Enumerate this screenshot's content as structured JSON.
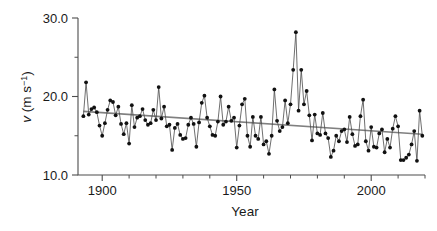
{
  "chart_data": {
    "type": "line",
    "title": "",
    "xlabel": "Year",
    "ylabel": "v (m s−1)",
    "ylabel_parts": {
      "italic": "v",
      "unit_open": " (m s",
      "exponent": "−1",
      "unit_close": ")"
    },
    "xlim": [
      1891,
      2020
    ],
    "ylim": [
      10.0,
      30.0
    ],
    "grid": false,
    "legend": null,
    "x_ticks_major": [
      1900,
      1950,
      2000
    ],
    "x_tick_labels": [
      "1900",
      "1950",
      "2000"
    ],
    "x_ticks_minor": [
      1900,
      1910,
      1920,
      1930,
      1940,
      1950,
      1960,
      1970,
      1980,
      1990,
      2000,
      2010,
      2020
    ],
    "y_ticks_major": [
      10.0,
      20.0,
      30.0
    ],
    "y_tick_labels": [
      "10.0",
      "20.0",
      "30.0"
    ],
    "y_ticks_minor": [
      15.0,
      25.0
    ],
    "marker_style": "filled-circle",
    "series": [
      {
        "name": "annual mean wind speed",
        "color": "#111111",
        "x": [
          1893,
          1894,
          1895,
          1896,
          1897,
          1898,
          1899,
          1900,
          1901,
          1902,
          1903,
          1904,
          1905,
          1906,
          1907,
          1908,
          1909,
          1910,
          1911,
          1912,
          1913,
          1914,
          1915,
          1916,
          1917,
          1918,
          1919,
          1920,
          1921,
          1922,
          1923,
          1924,
          1925,
          1926,
          1927,
          1928,
          1929,
          1930,
          1931,
          1932,
          1933,
          1934,
          1935,
          1936,
          1937,
          1938,
          1939,
          1940,
          1941,
          1942,
          1943,
          1944,
          1945,
          1946,
          1947,
          1948,
          1949,
          1950,
          1951,
          1952,
          1953,
          1954,
          1955,
          1956,
          1957,
          1958,
          1959,
          1960,
          1961,
          1962,
          1963,
          1964,
          1965,
          1966,
          1967,
          1968,
          1969,
          1970,
          1971,
          1972,
          1973,
          1974,
          1975,
          1976,
          1977,
          1978,
          1979,
          1980,
          1981,
          1982,
          1983,
          1984,
          1985,
          1986,
          1987,
          1988,
          1989,
          1990,
          1991,
          1992,
          1993,
          1994,
          1995,
          1996,
          1997,
          1998,
          1999,
          2000,
          2001,
          2002,
          2003,
          2004,
          2005,
          2006,
          2007,
          2008,
          2009,
          2010,
          2011,
          2012,
          2013,
          2014,
          2015,
          2016,
          2017,
          2018,
          2019
        ],
        "values": [
          17.5,
          21.8,
          17.7,
          18.4,
          18.6,
          18.0,
          16.3,
          15.0,
          16.6,
          18.3,
          19.5,
          19.3,
          17.6,
          18.7,
          16.5,
          15.2,
          16.6,
          14.0,
          18.9,
          16.1,
          17.3,
          17.5,
          18.4,
          17.0,
          16.4,
          16.6,
          18.3,
          17.0,
          21.2,
          17.2,
          18.7,
          16.2,
          16.4,
          13.2,
          16.0,
          16.5,
          15.1,
          14.6,
          14.7,
          16.4,
          17.3,
          16.5,
          13.6,
          16.7,
          19.2,
          20.1,
          17.3,
          16.2,
          15.1,
          15.0,
          16.8,
          20.0,
          16.4,
          16.8,
          18.7,
          16.9,
          17.3,
          13.5,
          16.3,
          19.0,
          19.7,
          15.0,
          13.6,
          17.4,
          15.0,
          14.6,
          17.4,
          13.9,
          14.3,
          12.7,
          15.0,
          20.9,
          16.9,
          15.6,
          16.1,
          19.5,
          16.6,
          19.0,
          23.4,
          28.2,
          18.2,
          23.4,
          19.0,
          20.7,
          17.6,
          14.4,
          17.7,
          15.3,
          15.1,
          17.9,
          15.3,
          14.7,
          12.3,
          13.1,
          15.0,
          14.3,
          15.6,
          15.8,
          14.2,
          17.4,
          15.2,
          13.7,
          13.9,
          17.5,
          19.6,
          14.3,
          13.1,
          16.1,
          13.6,
          13.5,
          15.3,
          15.8,
          12.9,
          14.6,
          13.5,
          15.9,
          17.5,
          16.2,
          11.9,
          11.9,
          12.2,
          12.6,
          13.9,
          15.6,
          11.8,
          18.2,
          15.0
        ]
      }
    ],
    "trend": {
      "name": "linear trend",
      "color": "#808080",
      "x": [
        1893,
        2019
      ],
      "values": [
        18.1,
        15.2
      ]
    }
  }
}
